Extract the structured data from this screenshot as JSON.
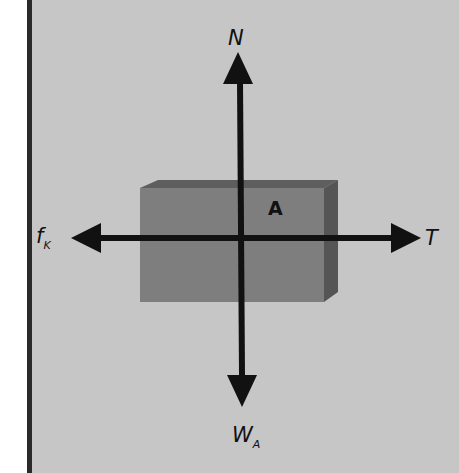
{
  "diagram": {
    "type": "free-body-diagram",
    "object": {
      "label": "A",
      "fill": "#7a7a7a",
      "side_fill": "#555555"
    },
    "background": "#c6c6c6",
    "border_color": "#2a2a2a",
    "forces": [
      {
        "id": "normal",
        "symbol": "N",
        "subscript": "",
        "direction": "up"
      },
      {
        "id": "tension",
        "symbol": "T",
        "subscript": "",
        "direction": "right"
      },
      {
        "id": "friction",
        "symbol": "f",
        "subscript": "K",
        "direction": "left"
      },
      {
        "id": "weight",
        "symbol": "W",
        "subscript": "A",
        "direction": "down"
      }
    ]
  }
}
